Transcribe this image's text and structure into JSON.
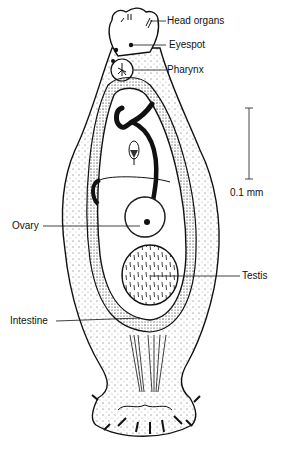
{
  "figure": {
    "labels": {
      "head_organs": "Head organs",
      "eyespot": "Eyespot",
      "pharynx": "Pharynx",
      "ovary": "Ovary",
      "testis": "Testis",
      "intestine": "Intestine"
    },
    "scale_bar": {
      "label": "0.1 mm"
    }
  }
}
